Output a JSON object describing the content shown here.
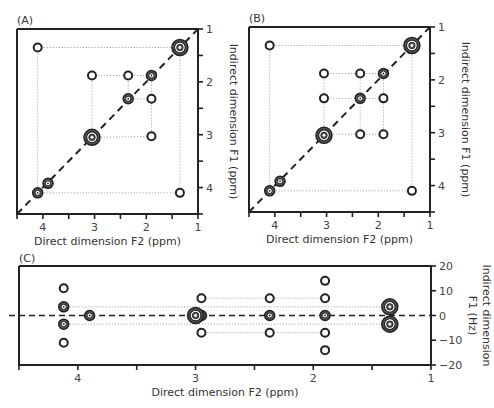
{
  "chart_data": [
    {
      "panel": "(A)",
      "type": "scatter",
      "xlabel": "Direct dimension F2 (ppm)",
      "ylabel": "Indirect dimension F1 (ppm)",
      "xlim": [
        4.5,
        1
      ],
      "ylim": [
        1,
        4.5
      ],
      "xticks": [
        4,
        3,
        2,
        1
      ],
      "yticks": [
        1,
        2,
        3,
        4
      ],
      "diagonal": true,
      "peaks": [
        {
          "x": 4.1,
          "y": 1.35,
          "kind": "cross"
        },
        {
          "x": 1.35,
          "y": 1.35,
          "kind": "diag-large"
        },
        {
          "x": 3.05,
          "y": 1.88,
          "kind": "cross"
        },
        {
          "x": 2.35,
          "y": 1.88,
          "kind": "cross"
        },
        {
          "x": 1.9,
          "y": 1.88,
          "kind": "diag"
        },
        {
          "x": 2.35,
          "y": 2.32,
          "kind": "diag"
        },
        {
          "x": 1.9,
          "y": 2.32,
          "kind": "cross"
        },
        {
          "x": 3.05,
          "y": 3.05,
          "kind": "diag-large"
        },
        {
          "x": 1.9,
          "y": 3.03,
          "kind": "cross"
        },
        {
          "x": 3.9,
          "y": 3.92,
          "kind": "diag"
        },
        {
          "x": 4.1,
          "y": 4.1,
          "kind": "diag"
        },
        {
          "x": 1.35,
          "y": 4.1,
          "kind": "cross"
        }
      ],
      "guides": [
        [
          [
            4.1,
            1.35
          ],
          [
            1.35,
            1.35
          ]
        ],
        [
          [
            4.1,
            1.35
          ],
          [
            4.1,
            4.1
          ]
        ],
        [
          [
            1.35,
            1.35
          ],
          [
            1.35,
            4.1
          ]
        ],
        [
          [
            4.1,
            4.1
          ],
          [
            1.35,
            4.1
          ]
        ],
        [
          [
            3.05,
            1.88
          ],
          [
            1.9,
            1.88
          ]
        ],
        [
          [
            3.05,
            1.88
          ],
          [
            3.05,
            3.05
          ]
        ],
        [
          [
            2.35,
            1.88
          ],
          [
            2.35,
            2.32
          ]
        ],
        [
          [
            2.35,
            2.32
          ],
          [
            1.9,
            2.32
          ]
        ],
        [
          [
            1.9,
            1.88
          ],
          [
            1.9,
            3.03
          ]
        ],
        [
          [
            3.05,
            3.05
          ],
          [
            1.9,
            3.03
          ]
        ]
      ]
    },
    {
      "panel": "(B)",
      "type": "scatter",
      "xlabel": "Direct dimension F2 (ppm)",
      "ylabel": "Indirect dimension F1 (ppm)",
      "xlim": [
        4.5,
        1
      ],
      "ylim": [
        1,
        4.5
      ],
      "xticks": [
        4,
        3,
        2,
        1
      ],
      "yticks": [
        1,
        2,
        3,
        4
      ],
      "diagonal": true,
      "peaks": [
        {
          "x": 4.1,
          "y": 1.35,
          "kind": "cross"
        },
        {
          "x": 1.35,
          "y": 1.35,
          "kind": "diag-large"
        },
        {
          "x": 3.05,
          "y": 1.88,
          "kind": "cross"
        },
        {
          "x": 2.35,
          "y": 1.88,
          "kind": "cross"
        },
        {
          "x": 1.9,
          "y": 1.88,
          "kind": "diag"
        },
        {
          "x": 3.05,
          "y": 2.35,
          "kind": "cross"
        },
        {
          "x": 2.35,
          "y": 2.35,
          "kind": "diag"
        },
        {
          "x": 1.9,
          "y": 2.35,
          "kind": "cross"
        },
        {
          "x": 3.05,
          "y": 3.05,
          "kind": "diag-large"
        },
        {
          "x": 2.35,
          "y": 3.03,
          "kind": "cross"
        },
        {
          "x": 1.9,
          "y": 3.03,
          "kind": "cross"
        },
        {
          "x": 3.9,
          "y": 3.92,
          "kind": "diag"
        },
        {
          "x": 4.1,
          "y": 4.1,
          "kind": "diag"
        },
        {
          "x": 1.35,
          "y": 4.1,
          "kind": "cross"
        }
      ],
      "guides": [
        [
          [
            4.1,
            1.35
          ],
          [
            1.35,
            1.35
          ]
        ],
        [
          [
            4.1,
            1.35
          ],
          [
            4.1,
            4.1
          ]
        ],
        [
          [
            1.35,
            1.35
          ],
          [
            1.35,
            4.1
          ]
        ],
        [
          [
            4.1,
            4.1
          ],
          [
            1.35,
            4.1
          ]
        ],
        [
          [
            3.05,
            1.88
          ],
          [
            1.9,
            1.88
          ]
        ],
        [
          [
            3.05,
            1.88
          ],
          [
            3.05,
            3.05
          ]
        ],
        [
          [
            2.35,
            1.88
          ],
          [
            2.35,
            3.03
          ]
        ],
        [
          [
            1.9,
            1.88
          ],
          [
            1.9,
            3.03
          ]
        ],
        [
          [
            3.05,
            2.35
          ],
          [
            1.9,
            2.35
          ]
        ],
        [
          [
            3.05,
            3.03
          ],
          [
            1.9,
            3.03
          ]
        ]
      ]
    },
    {
      "panel": "(C)",
      "type": "scatter",
      "xlabel": "Direct dimension F2 (ppm)",
      "ylabel": "Indirect dimension F1 (Hz)",
      "xlim": [
        4.5,
        1
      ],
      "ylim": [
        20,
        -20
      ],
      "xticks": [
        4,
        3,
        2,
        1
      ],
      "yticks": [
        20,
        10,
        0,
        -10,
        -20
      ],
      "ytick_labels": [
        "20",
        "10",
        "0",
        "−10",
        "−20"
      ],
      "zero_line": true,
      "peaks": [
        {
          "x": 4.12,
          "y": 11,
          "kind": "cross"
        },
        {
          "x": 4.12,
          "y": 3.5,
          "kind": "diag"
        },
        {
          "x": 4.12,
          "y": -3.5,
          "kind": "diag"
        },
        {
          "x": 4.12,
          "y": -11,
          "kind": "cross"
        },
        {
          "x": 3.9,
          "y": 0,
          "kind": "diag"
        },
        {
          "x": 2.95,
          "y": 0,
          "kind": "diag"
        },
        {
          "x": 3.0,
          "y": 0,
          "kind": "diag-large"
        },
        {
          "x": 2.95,
          "y": 7,
          "kind": "cross"
        },
        {
          "x": 2.95,
          "y": -7,
          "kind": "cross"
        },
        {
          "x": 2.37,
          "y": 7,
          "kind": "cross"
        },
        {
          "x": 2.37,
          "y": 0,
          "kind": "diag"
        },
        {
          "x": 2.37,
          "y": -7,
          "kind": "cross"
        },
        {
          "x": 1.9,
          "y": 14,
          "kind": "cross"
        },
        {
          "x": 1.9,
          "y": 7,
          "kind": "cross"
        },
        {
          "x": 1.9,
          "y": 0,
          "kind": "diag"
        },
        {
          "x": 1.9,
          "y": -7,
          "kind": "cross"
        },
        {
          "x": 1.9,
          "y": -14,
          "kind": "cross"
        },
        {
          "x": 1.35,
          "y": 3.5,
          "kind": "diag-large"
        },
        {
          "x": 1.35,
          "y": -3.5,
          "kind": "diag-large"
        }
      ],
      "guides": [
        [
          [
            4.12,
            3.5
          ],
          [
            1.35,
            3.5
          ]
        ],
        [
          [
            4.12,
            -3.5
          ],
          [
            1.35,
            -3.5
          ]
        ],
        [
          [
            2.95,
            7
          ],
          [
            1.9,
            7
          ]
        ],
        [
          [
            2.95,
            -7
          ],
          [
            1.9,
            -7
          ]
        ]
      ]
    }
  ],
  "layout": {
    "panels": [
      {
        "box": [
          17,
          29,
          198,
          214
        ],
        "label_pos": [
          17,
          24
        ]
      },
      {
        "box": [
          249,
          27,
          430,
          212
        ],
        "label_pos": [
          249,
          22
        ]
      },
      {
        "box": [
          19,
          266,
          431,
          365
        ],
        "label_pos": [
          19,
          262
        ]
      }
    ]
  }
}
